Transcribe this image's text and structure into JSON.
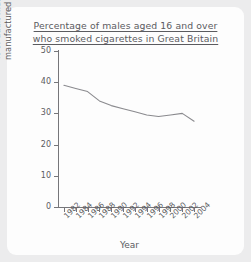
{
  "card": {
    "background": "#fdfdfd",
    "page_background": "#ececed"
  },
  "chart_data": {
    "type": "line",
    "title": "Percentage of males aged 16 and over who smoked cigarettes in Great Britain",
    "title_lines": [
      "Percentage of males aged 16 and over",
      "who smoked cigarettes in Great Britain"
    ],
    "xlabel": "Year",
    "ylabel": "% of adult males who smoked manufactured cigarettes",
    "ylabel_lines": [
      "% of adult males who smoked",
      "manufactured cigarettes"
    ],
    "xlim": [
      1981,
      2005
    ],
    "ylim": [
      0,
      50
    ],
    "yticks": [
      0,
      10,
      20,
      30,
      40,
      50
    ],
    "ytick_labels": [
      "0",
      "10",
      "20",
      "30",
      "40",
      "50"
    ],
    "xticks": [
      1982,
      1984,
      1986,
      1988,
      1990,
      1992,
      1994,
      1996,
      1998,
      2000,
      2002,
      2004
    ],
    "xtick_labels": [
      "1982",
      "1984",
      "1986",
      "1988",
      "1990",
      "1992",
      "1994",
      "1996",
      "1998",
      "2000",
      "2002",
      "2004"
    ],
    "grid": false,
    "legend": false,
    "line_color": "#8a8a8e",
    "x": [
      1982,
      1984,
      1986,
      1988,
      1990,
      1992,
      1994,
      1996,
      1998,
      2000,
      2002,
      2004
    ],
    "values": [
      39,
      38,
      37,
      34,
      32.5,
      31.5,
      30.5,
      29.5,
      29,
      29.5,
      30,
      27.5
    ],
    "series": [
      {
        "name": "% of adult males who smoked manufactured cigarettes",
        "values": [
          39,
          38,
          37,
          34,
          32.5,
          31.5,
          30.5,
          29.5,
          29,
          29.5,
          30,
          27.5
        ]
      }
    ]
  }
}
